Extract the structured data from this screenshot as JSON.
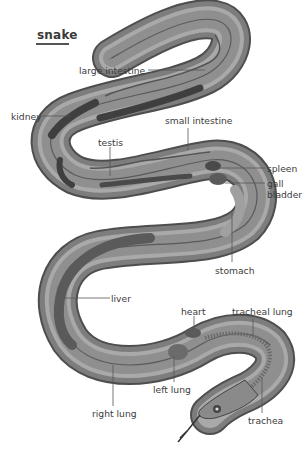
{
  "title": "snake",
  "labels": {
    "large_intestine": "large intestine",
    "kidney": "kidney",
    "small_intestine": "small intestine",
    "testis": "testis",
    "spleen": "spleen",
    "gall_bladder_1": "gall",
    "gall_bladder_2": "bladder",
    "stomach": "stomach",
    "liver": "liver",
    "heart": "heart",
    "tracheal_lung": "tracheal lung",
    "left_lung": "left lung",
    "right_lung": "right lung",
    "trachea": "trachea"
  },
  "colors": {
    "body_outer": "#5e5e5e",
    "body_mid": "#8a8a8a",
    "body_light": "#b5b5b5",
    "organ_dark": "#4a4a4a",
    "label_text": "#3c3c3c",
    "leader_line": "#555555"
  }
}
